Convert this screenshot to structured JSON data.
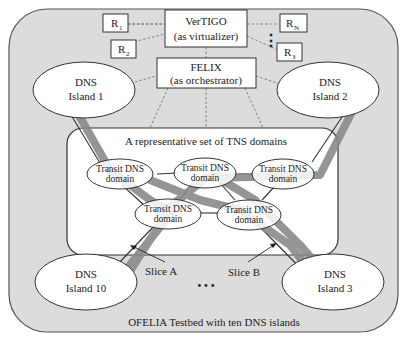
{
  "testbed": {
    "caption": "OFELIA Testbed with ten DNS islands",
    "background": "#dcdcdc",
    "border": "#555555"
  },
  "virtualizer": {
    "line1": "VerTIGO",
    "line2": "(as virtualizer)"
  },
  "orchestrator": {
    "line1": "FELIX",
    "line2": "(as orchestrator)"
  },
  "resources": [
    {
      "base": "R",
      "sub": "1"
    },
    {
      "base": "R",
      "sub": "2"
    },
    {
      "base": "R",
      "sub": "N"
    },
    {
      "base": "R",
      "sub": "3"
    }
  ],
  "islands": [
    {
      "line1": "DNS",
      "line2": "Island 1"
    },
    {
      "line1": "DNS",
      "line2": "Island 2"
    },
    {
      "line1": "DNS",
      "line2": "Island 10"
    },
    {
      "line1": "DNS",
      "line2": "Island 3"
    }
  ],
  "tns_box": {
    "title": "A representative set of TNS domains",
    "domains": [
      {
        "line1": "Transit DNS",
        "line2": "domain"
      },
      {
        "line1": "Transit DNS",
        "line2": "domain"
      },
      {
        "line1": "Transit DNS",
        "line2": "domain"
      },
      {
        "line1": "Transit DNS",
        "line2": "domain"
      },
      {
        "line1": "Transit DNS",
        "line2": "domain"
      }
    ]
  },
  "slices": [
    {
      "label": "Slice A",
      "color": "#8a8a8a"
    },
    {
      "label": "Slice B",
      "color": "#8a8a8a"
    }
  ],
  "ellipsis": "• • •",
  "vertical_ellipsis": "⋮"
}
